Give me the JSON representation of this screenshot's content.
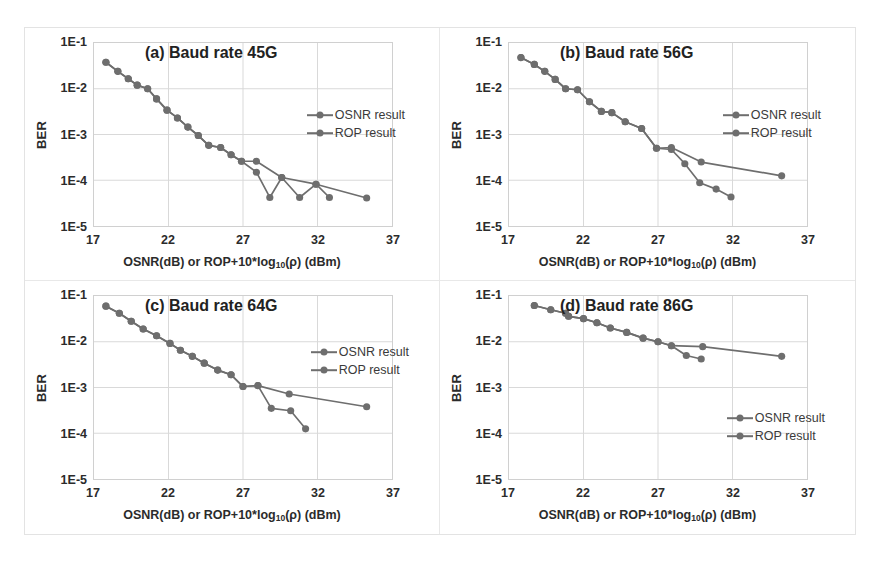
{
  "figure": {
    "axis_color": "#6e6e6e",
    "grid_color": "#d9d9d9",
    "text_color": "#2b2b2b"
  },
  "axes": {
    "xlabel_main": "OSNR(dB) or ROP+10*log",
    "xlabel_sub": "10",
    "xlabel_tail": "(ρ) (dBm)",
    "ylabel": "BER",
    "xticks": [
      "17",
      "22",
      "27",
      "32",
      "37"
    ],
    "yticks": [
      "1E-1",
      "1E-2",
      "1E-3",
      "1E-4",
      "1E-5"
    ],
    "xlim": [
      17,
      37
    ],
    "ylim_exp": [
      -5,
      -1
    ]
  },
  "legend": {
    "osnr": "OSNR result",
    "rop": "ROP result"
  },
  "chart_data": [
    {
      "id": "a",
      "type": "line",
      "title": "(a) Baud rate 45G",
      "xlabel": "OSNR(dB) or ROP+10*log10(ρ) (dBm)",
      "ylabel": "BER",
      "xlim": [
        17,
        37
      ],
      "ylim": [
        1e-05,
        0.1
      ],
      "yscale": "log",
      "grid": true,
      "legend_position": "center-right",
      "series": [
        {
          "name": "OSNR result",
          "x": [
            17.8,
            18.6,
            19.3,
            19.9,
            20.6,
            21.2,
            21.9,
            22.6,
            23.3,
            24.0,
            24.7,
            25.5,
            26.2,
            26.9,
            27.9,
            29.6,
            31.9,
            35.3
          ],
          "y": [
            0.038,
            0.024,
            0.0165,
            0.012,
            0.01,
            0.006,
            0.0034,
            0.0023,
            0.00145,
            0.00095,
            0.00058,
            0.00052,
            0.00036,
            0.00026,
            0.00026,
            0.000115,
            8.2e-05,
            4.1e-05
          ]
        },
        {
          "name": "ROP result",
          "x": [
            17.8,
            18.6,
            19.3,
            19.9,
            20.6,
            21.2,
            21.9,
            22.6,
            23.3,
            24.0,
            24.7,
            25.5,
            26.2,
            26.9,
            27.9,
            28.8,
            29.6,
            30.8,
            31.9,
            32.8
          ],
          "y": [
            0.038,
            0.024,
            0.0165,
            0.012,
            0.01,
            0.006,
            0.0034,
            0.0023,
            0.00145,
            0.00095,
            0.00058,
            0.00052,
            0.00036,
            0.00026,
            0.00015,
            4.2e-05,
            0.000115,
            4.2e-05,
            8.2e-05,
            4.2e-05
          ]
        }
      ]
    },
    {
      "id": "b",
      "type": "line",
      "title": "(b) Baud rate 56G",
      "xlabel": "OSNR(dB) or ROP+10*log10(ρ) (dBm)",
      "ylabel": "BER",
      "xlim": [
        17,
        37
      ],
      "ylim": [
        1e-05,
        0.1
      ],
      "yscale": "log",
      "grid": true,
      "legend_position": "center-right",
      "series": [
        {
          "name": "OSNR result",
          "x": [
            17.8,
            18.7,
            19.4,
            20.1,
            20.8,
            21.6,
            22.4,
            23.2,
            23.9,
            24.8,
            25.9,
            26.9,
            27.9,
            29.9,
            35.3
          ],
          "y": [
            0.048,
            0.034,
            0.024,
            0.016,
            0.01,
            0.0095,
            0.0052,
            0.0032,
            0.003,
            0.0019,
            0.00135,
            0.0005,
            0.00052,
            0.00025,
            0.000125
          ]
        },
        {
          "name": "ROP result",
          "x": [
            17.8,
            18.7,
            19.4,
            20.1,
            20.8,
            21.6,
            22.4,
            23.2,
            23.9,
            24.8,
            25.9,
            26.9,
            27.9,
            28.8,
            29.8,
            30.9,
            31.9
          ],
          "y": [
            0.048,
            0.034,
            0.024,
            0.016,
            0.01,
            0.0095,
            0.0052,
            0.0032,
            0.003,
            0.0019,
            0.00135,
            0.0005,
            0.00047,
            0.00023,
            8.8e-05,
            6.4e-05,
            4.3e-05
          ]
        }
      ]
    },
    {
      "id": "c",
      "type": "line",
      "title": "(c) Baud rate 64G",
      "xlabel": "OSNR(dB) or ROP+10*log10(ρ) (dBm)",
      "ylabel": "BER",
      "xlim": [
        17,
        37
      ],
      "ylim": [
        1e-05,
        0.1
      ],
      "yscale": "log",
      "grid": true,
      "legend_position": "upper-right",
      "series": [
        {
          "name": "OSNR result",
          "x": [
            17.8,
            18.7,
            19.5,
            20.3,
            21.2,
            22.1,
            22.8,
            23.6,
            24.4,
            25.3,
            26.2,
            27.0,
            28.0,
            30.1,
            35.3
          ],
          "y": [
            0.06,
            0.042,
            0.028,
            0.019,
            0.0135,
            0.0092,
            0.0065,
            0.0048,
            0.0034,
            0.0024,
            0.0019,
            0.00105,
            0.0011,
            0.00072,
            0.00038
          ]
        },
        {
          "name": "ROP result",
          "x": [
            17.8,
            18.7,
            19.5,
            20.3,
            21.2,
            22.1,
            22.8,
            23.6,
            24.4,
            25.3,
            26.2,
            27.0,
            28.0,
            28.9,
            30.2,
            31.2
          ],
          "y": [
            0.06,
            0.042,
            0.028,
            0.019,
            0.0135,
            0.0092,
            0.0065,
            0.0048,
            0.0034,
            0.0024,
            0.0019,
            0.00105,
            0.0011,
            0.00035,
            0.00031,
            0.000125
          ]
        }
      ]
    },
    {
      "id": "d",
      "type": "line",
      "title": "(d) Baud rate 86G",
      "xlabel": "OSNR(dB) or ROP+10*log10(ρ) (dBm)",
      "ylabel": "BER",
      "xlim": [
        17,
        37
      ],
      "ylim": [
        1e-05,
        0.1
      ],
      "yscale": "log",
      "grid": true,
      "legend_position": "lower-right",
      "series": [
        {
          "name": "OSNR result",
          "x": [
            18.7,
            19.8,
            20.8,
            21.0,
            22.0,
            22.9,
            23.8,
            24.9,
            26.0,
            27.0,
            27.9,
            30.0,
            35.3
          ],
          "y": [
            0.062,
            0.05,
            0.042,
            0.036,
            0.032,
            0.026,
            0.02,
            0.016,
            0.012,
            0.01,
            0.0082,
            0.0078,
            0.0048
          ]
        },
        {
          "name": "ROP result",
          "x": [
            18.7,
            19.8,
            20.8,
            21.0,
            22.0,
            22.9,
            23.8,
            24.9,
            26.0,
            27.0,
            27.9,
            28.9,
            29.9
          ],
          "y": [
            0.062,
            0.05,
            0.042,
            0.036,
            0.032,
            0.026,
            0.02,
            0.016,
            0.012,
            0.01,
            0.0082,
            0.005,
            0.0042
          ]
        }
      ]
    }
  ]
}
